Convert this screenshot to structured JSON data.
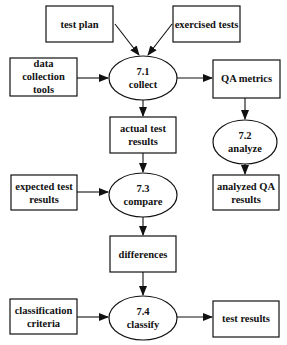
{
  "diagram": {
    "nodes": {
      "test_plan": {
        "lines": [
          "test plan"
        ]
      },
      "exercised_tests": {
        "lines": [
          "exercised tests"
        ]
      },
      "data_collection_tools": {
        "lines": [
          "data",
          "collection",
          "tools"
        ]
      },
      "p71": {
        "lines": [
          "7.1",
          "collect"
        ]
      },
      "qa_metrics": {
        "lines": [
          "QA metrics"
        ]
      },
      "actual_test_results": {
        "lines": [
          "actual test",
          "results"
        ]
      },
      "p72": {
        "lines": [
          "7.2",
          "analyze"
        ]
      },
      "expected_test_results": {
        "lines": [
          "expected test",
          "results"
        ]
      },
      "p73": {
        "lines": [
          "7.3",
          "compare"
        ]
      },
      "analyzed_qa_results": {
        "lines": [
          "analyzed QA",
          "results"
        ]
      },
      "differences": {
        "lines": [
          "differences"
        ]
      },
      "classification_criteria": {
        "lines": [
          "classification",
          "criteria"
        ]
      },
      "p74": {
        "lines": [
          "7.4",
          "classify"
        ]
      },
      "test_results": {
        "lines": [
          "test results"
        ]
      }
    },
    "edges": [
      [
        "test_plan",
        "p71"
      ],
      [
        "exercised_tests",
        "p71"
      ],
      [
        "data_collection_tools",
        "p71"
      ],
      [
        "p71",
        "qa_metrics"
      ],
      [
        "p71",
        "actual_test_results"
      ],
      [
        "qa_metrics",
        "p72"
      ],
      [
        "p72",
        "analyzed_qa_results"
      ],
      [
        "actual_test_results",
        "p73"
      ],
      [
        "expected_test_results",
        "p73"
      ],
      [
        "p73",
        "differences"
      ],
      [
        "differences",
        "p74"
      ],
      [
        "classification_criteria",
        "p74"
      ],
      [
        "p74",
        "test_results"
      ]
    ]
  }
}
